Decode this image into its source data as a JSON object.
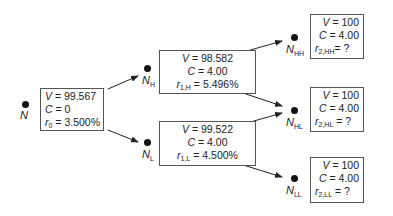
{
  "diagram": {
    "type": "binomial-interest-rate-tree",
    "colors": {
      "line": "#222222",
      "box_border": "#555555",
      "text": "#222222"
    },
    "nodes": {
      "root": {
        "label": "N",
        "sub": "",
        "V_label": "V",
        "V_value": "= 99.567",
        "C_label": "C",
        "C_value": "= 0",
        "r_label": "r",
        "r_sub": "0",
        "r_value": "= 3.500%"
      },
      "h": {
        "label": "N",
        "sub": "H",
        "V_label": "V",
        "V_value": "= 98.582",
        "C_label": "C",
        "C_value": "= 4.00",
        "r_label": "r",
        "r_sub": "1,H",
        "r_value": "= 5.496%"
      },
      "l": {
        "label": "N",
        "sub": "L",
        "V_label": "V",
        "V_value": "= 99.522",
        "C_label": "C",
        "C_value": "= 4.00",
        "r_label": "r",
        "r_sub": "1,L",
        "r_value": "= 4.500%"
      },
      "hh": {
        "label": "N",
        "sub": "HH",
        "V_label": "V",
        "V_value": "= 100",
        "C_label": "C",
        "C_value": "= 4.00",
        "r_label": "r",
        "r_sub": "2,HH",
        "r_value": "= ?"
      },
      "hl": {
        "label": "N",
        "sub": "HL",
        "V_label": "V",
        "V_value": "= 100",
        "C_label": "C",
        "C_value": "= 4.00",
        "r_label": "r",
        "r_sub": "2,HL",
        "r_value": "= ?"
      },
      "ll": {
        "label": "N",
        "sub": "LL",
        "V_label": "V",
        "V_value": "= 100",
        "C_label": "C",
        "C_value": "= 4.00",
        "r_label": "r",
        "r_sub": "2,LL",
        "r_value": "= ?"
      }
    },
    "edges": [
      {
        "from": "root",
        "to": "h"
      },
      {
        "from": "root",
        "to": "l"
      },
      {
        "from": "h",
        "to": "hh"
      },
      {
        "from": "h",
        "to": "hl"
      },
      {
        "from": "l",
        "to": "hl"
      },
      {
        "from": "l",
        "to": "ll"
      }
    ]
  }
}
